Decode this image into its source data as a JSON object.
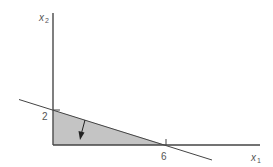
{
  "diagram": {
    "type": "linear-program-feasible-region",
    "axes": {
      "x": {
        "label": "x",
        "subscript": "1"
      },
      "y": {
        "label": "x",
        "subscript": "2"
      }
    },
    "ticks": {
      "y_intercept": "2",
      "x_intercept": "6"
    },
    "constraint_line": {
      "x_intercept": 6,
      "y_intercept": 2
    },
    "shaded_region": "triangle (0,0)-(6,0)-(0,2)",
    "arrow": "points into feasible region (below line)",
    "colors": {
      "axis": "#555555",
      "line": "#444444",
      "fill": "#c4c4c4",
      "text": "#555555"
    }
  }
}
